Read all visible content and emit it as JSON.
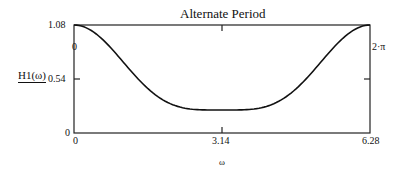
{
  "chart_data": {
    "type": "line",
    "title": "Alternate Period",
    "xlabel": "ω",
    "ylabel": "H1(ω)",
    "xlim": [
      0,
      6.28
    ],
    "ylim": [
      0,
      1.08
    ],
    "x_ticks": [
      "0",
      "3.14",
      "6.28"
    ],
    "y_ticks": [
      "0",
      "0.54",
      "1.08"
    ],
    "markers": {
      "x_start": "0",
      "x_end": "2·π"
    },
    "grid": false,
    "series": [
      {
        "name": "H1(ω)",
        "x": [
          0,
          0.785,
          1.571,
          2.356,
          3.14,
          3.927,
          4.712,
          5.498,
          6.28
        ],
        "y": [
          1.08,
          0.85,
          0.44,
          0.25,
          0.23,
          0.25,
          0.44,
          0.85,
          1.08
        ]
      }
    ]
  },
  "labels": {
    "title": "Alternate Period",
    "y_axis": "H1(ω)",
    "x_axis": "ω",
    "y_top": "1.08",
    "y_mid": "0.54",
    "y_bottom": "0",
    "x_left": "0",
    "x_mid": "3.14",
    "x_right": "6.28",
    "left_marker": "0",
    "right_marker": "2·π"
  }
}
